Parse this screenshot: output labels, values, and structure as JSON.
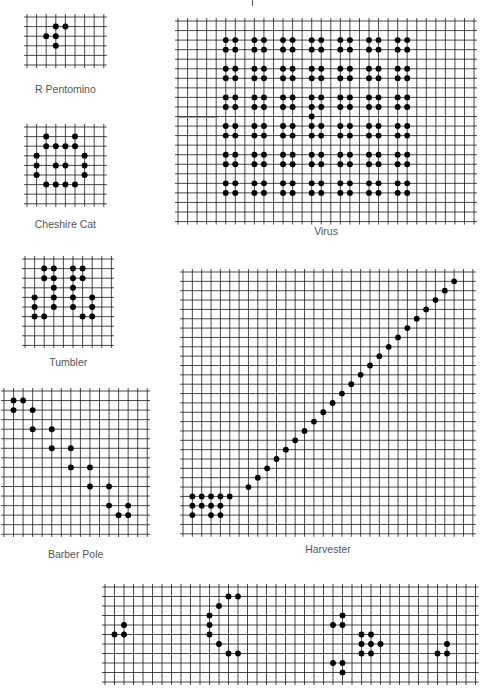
{
  "figures": [
    {
      "id": "r-pentomino",
      "label": "R Pentomino",
      "x": 27,
      "y": 17,
      "cols": 8,
      "rows": 5,
      "cell": 9.6,
      "label_y": 83,
      "cells": [
        [
          1,
          3
        ],
        [
          1,
          4
        ],
        [
          2,
          2
        ],
        [
          2,
          3
        ],
        [
          3,
          3
        ]
      ]
    },
    {
      "id": "cheshire-cat",
      "label": "Cheshire Cat",
      "x": 27,
      "y": 127,
      "cols": 8,
      "rows": 8,
      "cell": 9.6,
      "label_y": 218,
      "cells": [
        [
          1,
          2
        ],
        [
          1,
          5
        ],
        [
          2,
          2
        ],
        [
          2,
          3
        ],
        [
          2,
          4
        ],
        [
          2,
          5
        ],
        [
          3,
          1
        ],
        [
          3,
          6
        ],
        [
          4,
          1
        ],
        [
          4,
          3
        ],
        [
          4,
          4
        ],
        [
          4,
          6
        ],
        [
          5,
          1
        ],
        [
          5,
          6
        ],
        [
          6,
          2
        ],
        [
          6,
          3
        ],
        [
          6,
          4
        ],
        [
          6,
          5
        ]
      ]
    },
    {
      "id": "tumbler",
      "label": "Tumbler",
      "x": 25,
      "y": 259,
      "cols": 9,
      "rows": 9,
      "cell": 9.6,
      "label_y": 356,
      "cells": [
        [
          1,
          2
        ],
        [
          1,
          3
        ],
        [
          1,
          5
        ],
        [
          1,
          6
        ],
        [
          2,
          2
        ],
        [
          2,
          3
        ],
        [
          2,
          5
        ],
        [
          2,
          6
        ],
        [
          3,
          3
        ],
        [
          3,
          5
        ],
        [
          4,
          1
        ],
        [
          4,
          3
        ],
        [
          4,
          5
        ],
        [
          4,
          7
        ],
        [
          5,
          1
        ],
        [
          5,
          3
        ],
        [
          5,
          5
        ],
        [
          5,
          7
        ],
        [
          6,
          1
        ],
        [
          6,
          2
        ],
        [
          6,
          6
        ],
        [
          6,
          7
        ]
      ]
    },
    {
      "id": "barber-pole",
      "label": "Barber Pole",
      "x": 4,
      "y": 391,
      "cols": 15,
      "rows": 15,
      "cell": 9.55,
      "label_y": 548,
      "cells": [
        [
          1,
          1
        ],
        [
          1,
          2
        ],
        [
          2,
          1
        ],
        [
          2,
          3
        ],
        [
          4,
          3
        ],
        [
          4,
          5
        ],
        [
          6,
          5
        ],
        [
          6,
          7
        ],
        [
          8,
          7
        ],
        [
          8,
          9
        ],
        [
          10,
          9
        ],
        [
          10,
          11
        ],
        [
          12,
          11
        ],
        [
          12,
          13
        ],
        [
          13,
          12
        ],
        [
          13,
          13
        ]
      ]
    },
    {
      "id": "virus",
      "label": "Virus",
      "x": 178,
      "y": 21,
      "cols": 31,
      "rows": 21,
      "cell": 9.55,
      "label_y": 225,
      "cells": [
        [
          2,
          5
        ],
        [
          2,
          6
        ],
        [
          3,
          5
        ],
        [
          3,
          6
        ],
        [
          2,
          8
        ],
        [
          2,
          9
        ],
        [
          3,
          8
        ],
        [
          3,
          9
        ],
        [
          2,
          11
        ],
        [
          2,
          12
        ],
        [
          3,
          11
        ],
        [
          3,
          12
        ],
        [
          2,
          14
        ],
        [
          2,
          15
        ],
        [
          3,
          14
        ],
        [
          3,
          15
        ],
        [
          2,
          17
        ],
        [
          2,
          18
        ],
        [
          3,
          17
        ],
        [
          3,
          18
        ],
        [
          2,
          20
        ],
        [
          2,
          21
        ],
        [
          3,
          20
        ],
        [
          3,
          21
        ],
        [
          2,
          23
        ],
        [
          2,
          24
        ],
        [
          3,
          23
        ],
        [
          3,
          24
        ],
        [
          5,
          5
        ],
        [
          5,
          6
        ],
        [
          6,
          5
        ],
        [
          6,
          6
        ],
        [
          5,
          8
        ],
        [
          5,
          9
        ],
        [
          6,
          8
        ],
        [
          6,
          9
        ],
        [
          5,
          11
        ],
        [
          5,
          12
        ],
        [
          6,
          11
        ],
        [
          6,
          12
        ],
        [
          5,
          14
        ],
        [
          5,
          15
        ],
        [
          6,
          14
        ],
        [
          6,
          15
        ],
        [
          5,
          17
        ],
        [
          5,
          18
        ],
        [
          6,
          17
        ],
        [
          6,
          18
        ],
        [
          5,
          20
        ],
        [
          5,
          21
        ],
        [
          6,
          20
        ],
        [
          6,
          21
        ],
        [
          5,
          23
        ],
        [
          5,
          24
        ],
        [
          6,
          23
        ],
        [
          6,
          24
        ],
        [
          8,
          5
        ],
        [
          8,
          6
        ],
        [
          9,
          5
        ],
        [
          9,
          6
        ],
        [
          8,
          8
        ],
        [
          8,
          9
        ],
        [
          9,
          8
        ],
        [
          9,
          9
        ],
        [
          8,
          11
        ],
        [
          8,
          12
        ],
        [
          9,
          11
        ],
        [
          9,
          12
        ],
        [
          8,
          14
        ],
        [
          8,
          15
        ],
        [
          9,
          14
        ],
        [
          9,
          15
        ],
        [
          8,
          17
        ],
        [
          8,
          18
        ],
        [
          9,
          17
        ],
        [
          9,
          18
        ],
        [
          8,
          20
        ],
        [
          8,
          21
        ],
        [
          9,
          20
        ],
        [
          9,
          21
        ],
        [
          8,
          23
        ],
        [
          8,
          24
        ],
        [
          9,
          23
        ],
        [
          9,
          24
        ],
        [
          10,
          14
        ],
        [
          11,
          5
        ],
        [
          11,
          6
        ],
        [
          12,
          5
        ],
        [
          12,
          6
        ],
        [
          11,
          8
        ],
        [
          11,
          9
        ],
        [
          12,
          8
        ],
        [
          12,
          9
        ],
        [
          11,
          11
        ],
        [
          11,
          12
        ],
        [
          12,
          11
        ],
        [
          12,
          12
        ],
        [
          11,
          14
        ],
        [
          11,
          15
        ],
        [
          12,
          14
        ],
        [
          12,
          15
        ],
        [
          11,
          17
        ],
        [
          11,
          18
        ],
        [
          12,
          17
        ],
        [
          12,
          18
        ],
        [
          11,
          20
        ],
        [
          11,
          21
        ],
        [
          12,
          20
        ],
        [
          12,
          21
        ],
        [
          11,
          23
        ],
        [
          11,
          24
        ],
        [
          12,
          23
        ],
        [
          12,
          24
        ],
        [
          14,
          5
        ],
        [
          14,
          6
        ],
        [
          15,
          5
        ],
        [
          15,
          6
        ],
        [
          14,
          8
        ],
        [
          14,
          9
        ],
        [
          15,
          8
        ],
        [
          15,
          9
        ],
        [
          14,
          11
        ],
        [
          14,
          12
        ],
        [
          15,
          11
        ],
        [
          15,
          12
        ],
        [
          14,
          14
        ],
        [
          14,
          15
        ],
        [
          15,
          14
        ],
        [
          15,
          15
        ],
        [
          14,
          17
        ],
        [
          14,
          18
        ],
        [
          15,
          17
        ],
        [
          15,
          18
        ],
        [
          14,
          20
        ],
        [
          14,
          21
        ],
        [
          15,
          20
        ],
        [
          15,
          21
        ],
        [
          14,
          23
        ],
        [
          14,
          24
        ],
        [
          15,
          23
        ],
        [
          15,
          24
        ],
        [
          17,
          5
        ],
        [
          17,
          6
        ],
        [
          18,
          5
        ],
        [
          18,
          6
        ],
        [
          17,
          8
        ],
        [
          17,
          9
        ],
        [
          18,
          8
        ],
        [
          18,
          9
        ],
        [
          17,
          11
        ],
        [
          17,
          12
        ],
        [
          18,
          11
        ],
        [
          18,
          12
        ],
        [
          17,
          14
        ],
        [
          17,
          15
        ],
        [
          18,
          14
        ],
        [
          18,
          15
        ],
        [
          17,
          17
        ],
        [
          17,
          18
        ],
        [
          18,
          17
        ],
        [
          18,
          18
        ],
        [
          17,
          20
        ],
        [
          17,
          21
        ],
        [
          18,
          20
        ],
        [
          18,
          21
        ],
        [
          17,
          23
        ],
        [
          17,
          24
        ],
        [
          18,
          23
        ],
        [
          18,
          24
        ]
      ]
    },
    {
      "id": "harvester",
      "label": "Harvester",
      "x": 183,
      "y": 272,
      "cols": 31,
      "rows": 28,
      "cell": 9.35,
      "label_y": 543,
      "cells": [
        [
          24,
          1
        ],
        [
          24,
          2
        ],
        [
          24,
          3
        ],
        [
          24,
          4
        ],
        [
          24,
          5
        ],
        [
          25,
          1
        ],
        [
          25,
          2
        ],
        [
          25,
          3
        ],
        [
          25,
          4
        ],
        [
          26,
          1
        ],
        [
          26,
          3
        ],
        [
          26,
          4
        ],
        [
          23,
          7
        ],
        [
          22,
          8
        ],
        [
          21,
          9
        ],
        [
          20,
          10
        ],
        [
          19,
          11
        ],
        [
          18,
          12
        ],
        [
          17,
          13
        ],
        [
          16,
          14
        ],
        [
          15,
          15
        ],
        [
          14,
          16
        ],
        [
          13,
          17
        ],
        [
          12,
          18
        ],
        [
          11,
          19
        ],
        [
          10,
          20
        ],
        [
          9,
          21
        ],
        [
          8,
          22
        ],
        [
          7,
          23
        ],
        [
          6,
          24
        ],
        [
          5,
          25
        ],
        [
          4,
          26
        ],
        [
          3,
          27
        ],
        [
          2,
          28
        ],
        [
          1,
          29
        ]
      ]
    },
    {
      "id": "glider-gun-strip",
      "label": "",
      "x": 105,
      "y": 587,
      "cols": 39,
      "rows": 10,
      "cell": 9.5,
      "label_y": null,
      "cells": [
        [
          4,
          2
        ],
        [
          5,
          1
        ],
        [
          5,
          2
        ],
        [
          1,
          13
        ],
        [
          1,
          14
        ],
        [
          2,
          12
        ],
        [
          3,
          11
        ],
        [
          4,
          11
        ],
        [
          5,
          11
        ],
        [
          6,
          12
        ],
        [
          7,
          13
        ],
        [
          7,
          14
        ],
        [
          3,
          25
        ],
        [
          4,
          24
        ],
        [
          4,
          25
        ],
        [
          5,
          27
        ],
        [
          5,
          28
        ],
        [
          6,
          27
        ],
        [
          6,
          28
        ],
        [
          6,
          29
        ],
        [
          7,
          27
        ],
        [
          7,
          28
        ],
        [
          8,
          24
        ],
        [
          8,
          25
        ],
        [
          9,
          25
        ],
        [
          6,
          36
        ],
        [
          7,
          35
        ],
        [
          7,
          36
        ]
      ]
    }
  ],
  "colors": {
    "grid": "#1a1a1a",
    "dot": "#000000",
    "label": "#555555",
    "background": "#ffffff"
  }
}
